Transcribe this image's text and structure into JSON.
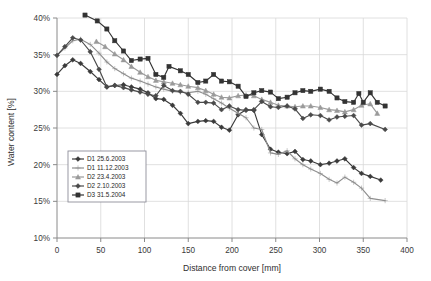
{
  "chart_data": {
    "type": "line",
    "title": "",
    "xlabel": "Distance from cover [mm]",
    "ylabel": "Water content [%]",
    "xlim": [
      0,
      400
    ],
    "ylim": [
      10,
      40
    ],
    "xticks": [
      0,
      50,
      100,
      150,
      200,
      250,
      300,
      350,
      400
    ],
    "xtick_labels": [
      "0",
      "50",
      "100",
      "150",
      "200",
      "250",
      "300",
      "350",
      "400"
    ],
    "yticks": [
      10,
      15,
      20,
      25,
      30,
      35,
      40
    ],
    "ytick_labels": [
      "10%",
      "15%",
      "20%",
      "25%",
      "30%",
      "35%",
      "40%"
    ],
    "grid": true,
    "legend_position": "lower-left",
    "series": [
      {
        "name": "D1 25.6.2003",
        "color": "#3a3a3a",
        "marker": "diamond",
        "points": [
          [
            0,
            32.3
          ],
          [
            9,
            33.5
          ],
          [
            18,
            34.3
          ],
          [
            27,
            33.8
          ],
          [
            38,
            32.7
          ],
          [
            48,
            31.6
          ],
          [
            57,
            30.6
          ],
          [
            66,
            30.8
          ],
          [
            76,
            30.9
          ],
          [
            85,
            30.6
          ],
          [
            95,
            30.3
          ],
          [
            104,
            29.8
          ],
          [
            113,
            29.0
          ],
          [
            122,
            28.9
          ],
          [
            132,
            28.1
          ],
          [
            141,
            27.0
          ],
          [
            150,
            25.6
          ],
          [
            161,
            25.9
          ],
          [
            170,
            26.0
          ],
          [
            179,
            25.9
          ],
          [
            188,
            25.1
          ],
          [
            197,
            24.7
          ],
          [
            207,
            26.8
          ],
          [
            216,
            27.5
          ],
          [
            225,
            27.4
          ],
          [
            234,
            24.1
          ],
          [
            244,
            22.1
          ],
          [
            253,
            21.7
          ],
          [
            263,
            21.5
          ],
          [
            272,
            21.8
          ],
          [
            281,
            20.7
          ],
          [
            290,
            20.5
          ],
          [
            301,
            20.0
          ],
          [
            311,
            20.2
          ],
          [
            320,
            20.5
          ],
          [
            329,
            20.8
          ],
          [
            339,
            19.6
          ],
          [
            348,
            18.8
          ],
          [
            358,
            18.4
          ],
          [
            370,
            17.9
          ]
        ]
      },
      {
        "name": "D1 11.12.2003",
        "color": "#8e8e8e",
        "marker": "plus",
        "points": [
          [
            0,
            34.9
          ],
          [
            9,
            35.9
          ],
          [
            18,
            36.9
          ],
          [
            27,
            37.1
          ],
          [
            38,
            36.4
          ],
          [
            48,
            35.2
          ],
          [
            57,
            34.0
          ],
          [
            66,
            33.1
          ],
          [
            76,
            32.4
          ],
          [
            85,
            31.8
          ],
          [
            95,
            31.4
          ],
          [
            104,
            31.0
          ],
          [
            113,
            30.6
          ],
          [
            122,
            30.3
          ],
          [
            132,
            30.0
          ],
          [
            141,
            29.9
          ],
          [
            150,
            29.8
          ],
          [
            161,
            30.0
          ],
          [
            170,
            29.6
          ],
          [
            179,
            29.0
          ],
          [
            188,
            28.4
          ],
          [
            197,
            27.7
          ],
          [
            207,
            27.0
          ],
          [
            216,
            26.4
          ],
          [
            225,
            25.0
          ],
          [
            234,
            24.8
          ],
          [
            244,
            21.6
          ],
          [
            253,
            21.4
          ],
          [
            263,
            21.9
          ],
          [
            272,
            20.8
          ],
          [
            281,
            20.0
          ],
          [
            290,
            19.4
          ],
          [
            301,
            18.8
          ],
          [
            311,
            18.0
          ],
          [
            320,
            17.5
          ],
          [
            329,
            18.3
          ],
          [
            339,
            17.6
          ],
          [
            348,
            16.8
          ],
          [
            358,
            15.4
          ],
          [
            375,
            15.1
          ]
        ]
      },
      {
        "name": "D2 23.4.2003",
        "color": "#9a9a9a",
        "marker": "triangle",
        "points": [
          [
            45,
            36.8
          ],
          [
            55,
            36.1
          ],
          [
            66,
            35.1
          ],
          [
            76,
            34.3
          ],
          [
            85,
            33.4
          ],
          [
            95,
            32.6
          ],
          [
            104,
            32.0
          ],
          [
            113,
            31.5
          ],
          [
            122,
            31.3
          ],
          [
            132,
            31.1
          ],
          [
            141,
            30.9
          ],
          [
            150,
            30.7
          ],
          [
            161,
            30.5
          ],
          [
            170,
            30.1
          ],
          [
            179,
            29.6
          ],
          [
            188,
            29.2
          ],
          [
            197,
            29.1
          ],
          [
            207,
            29.4
          ],
          [
            216,
            29.5
          ],
          [
            225,
            29.4
          ],
          [
            234,
            28.9
          ],
          [
            244,
            28.5
          ],
          [
            253,
            28.1
          ],
          [
            263,
            28.0
          ],
          [
            272,
            27.9
          ],
          [
            281,
            28.0
          ],
          [
            290,
            28.0
          ],
          [
            301,
            27.8
          ],
          [
            311,
            27.5
          ],
          [
            320,
            27.4
          ],
          [
            329,
            27.2
          ],
          [
            339,
            27.5
          ],
          [
            348,
            28.1
          ],
          [
            358,
            28.3
          ],
          [
            366,
            27.0
          ]
        ]
      },
      {
        "name": "D2 2.10.2003",
        "color": "#4a4a4a",
        "marker": "diamond",
        "points": [
          [
            0,
            34.9
          ],
          [
            9,
            36.1
          ],
          [
            18,
            37.3
          ],
          [
            27,
            37.0
          ],
          [
            38,
            35.4
          ],
          [
            48,
            33.0
          ],
          [
            57,
            30.6
          ],
          [
            66,
            30.8
          ],
          [
            76,
            30.5
          ],
          [
            85,
            30.2
          ],
          [
            95,
            29.9
          ],
          [
            104,
            29.6
          ],
          [
            113,
            29.4
          ],
          [
            122,
            30.8
          ],
          [
            132,
            30.1
          ],
          [
            141,
            30.0
          ],
          [
            150,
            29.6
          ],
          [
            161,
            28.5
          ],
          [
            170,
            28.5
          ],
          [
            179,
            28.4
          ],
          [
            188,
            27.5
          ],
          [
            197,
            28.0
          ],
          [
            207,
            27.5
          ],
          [
            216,
            27.4
          ],
          [
            225,
            27.5
          ],
          [
            234,
            28.6
          ],
          [
            244,
            27.9
          ],
          [
            253,
            27.8
          ],
          [
            263,
            28.0
          ],
          [
            272,
            27.6
          ],
          [
            281,
            26.3
          ],
          [
            290,
            26.8
          ],
          [
            301,
            26.7
          ],
          [
            311,
            26.1
          ],
          [
            320,
            26.5
          ],
          [
            329,
            26.6
          ],
          [
            339,
            26.7
          ],
          [
            348,
            25.4
          ],
          [
            358,
            25.6
          ],
          [
            375,
            24.8
          ]
        ]
      },
      {
        "name": "D3 31.5.2004",
        "color": "#333333",
        "marker": "square",
        "points": [
          [
            32,
            40.4
          ],
          [
            46,
            39.6
          ],
          [
            57,
            38.5
          ],
          [
            66,
            36.9
          ],
          [
            76,
            35.5
          ],
          [
            85,
            34.2
          ],
          [
            95,
            34.4
          ],
          [
            104,
            34.5
          ],
          [
            113,
            32.3
          ],
          [
            122,
            31.9
          ],
          [
            128,
            33.4
          ],
          [
            141,
            32.8
          ],
          [
            150,
            32.3
          ],
          [
            161,
            31.2
          ],
          [
            170,
            31.4
          ],
          [
            179,
            32.3
          ],
          [
            188,
            31.4
          ],
          [
            197,
            31.3
          ],
          [
            207,
            30.7
          ],
          [
            216,
            29.3
          ],
          [
            225,
            29.8
          ],
          [
            234,
            30.1
          ],
          [
            244,
            29.9
          ],
          [
            253,
            29.0
          ],
          [
            263,
            29.2
          ],
          [
            272,
            29.8
          ],
          [
            281,
            30.1
          ],
          [
            290,
            30.0
          ],
          [
            301,
            30.3
          ],
          [
            311,
            30.0
          ],
          [
            320,
            29.1
          ],
          [
            329,
            28.6
          ],
          [
            339,
            28.5
          ],
          [
            345,
            29.7
          ],
          [
            350,
            28.5
          ],
          [
            358,
            29.8
          ],
          [
            366,
            28.5
          ],
          [
            375,
            28.0
          ]
        ]
      }
    ]
  }
}
